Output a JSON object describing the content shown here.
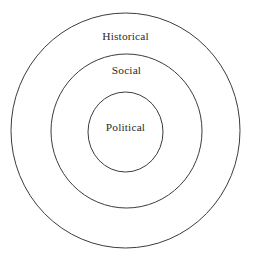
{
  "diagram": {
    "type": "concentric-circles",
    "title": "",
    "background_color": "#ffffff",
    "stroke_color": "#3c3c3c",
    "text_color": "#2b2b2b",
    "rings": [
      {
        "id": "outer",
        "label": "Historical",
        "level": 1,
        "label_position": "top-of-ring",
        "center_x": 125.5,
        "center_y": 130.5,
        "radius_x": 114.5,
        "radius_y": 117.5
      },
      {
        "id": "middle",
        "label": "Social",
        "level": 2,
        "label_position": "top-of-ring",
        "center_x": 126.5,
        "center_y": 131.0,
        "radius_x": 75.5,
        "radius_y": 77.0
      },
      {
        "id": "inner",
        "label": "Political",
        "level": 3,
        "label_position": "center",
        "center_x": 125.5,
        "center_y": 132.0,
        "radius_x": 37.5,
        "radius_y": 40.0
      }
    ]
  },
  "chart_data": {
    "type": "diagram",
    "subtype": "concentric-circles",
    "title": "",
    "categories": [
      "Historical",
      "Social",
      "Political"
    ],
    "values": [
      1,
      2,
      3
    ],
    "nesting_order_outer_to_inner": [
      "Historical",
      "Social",
      "Political"
    ],
    "legend": [],
    "xlabel": "",
    "ylabel": ""
  }
}
